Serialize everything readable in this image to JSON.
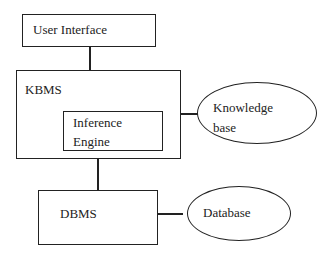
{
  "diagram": {
    "nodes": {
      "user_interface": {
        "label": "User Interface",
        "shape": "rectangle"
      },
      "kbms": {
        "label": "KBMS",
        "shape": "rectangle"
      },
      "inference_engine": {
        "line1": "Inference",
        "line2": "Engine",
        "shape": "rectangle"
      },
      "knowledge_base": {
        "line1": "Knowledge",
        "line2": "base",
        "shape": "ellipse"
      },
      "dbms": {
        "label": "DBMS",
        "shape": "rectangle"
      },
      "database": {
        "label": "Database",
        "shape": "ellipse"
      }
    },
    "edges": [
      {
        "from": "User Interface",
        "to": "KBMS"
      },
      {
        "from": "KBMS",
        "to": "Knowledge base"
      },
      {
        "from": "KBMS",
        "to": "DBMS"
      },
      {
        "from": "DBMS",
        "to": "Database"
      }
    ],
    "colors": {
      "stroke": "#222222",
      "background": "#ffffff"
    }
  }
}
